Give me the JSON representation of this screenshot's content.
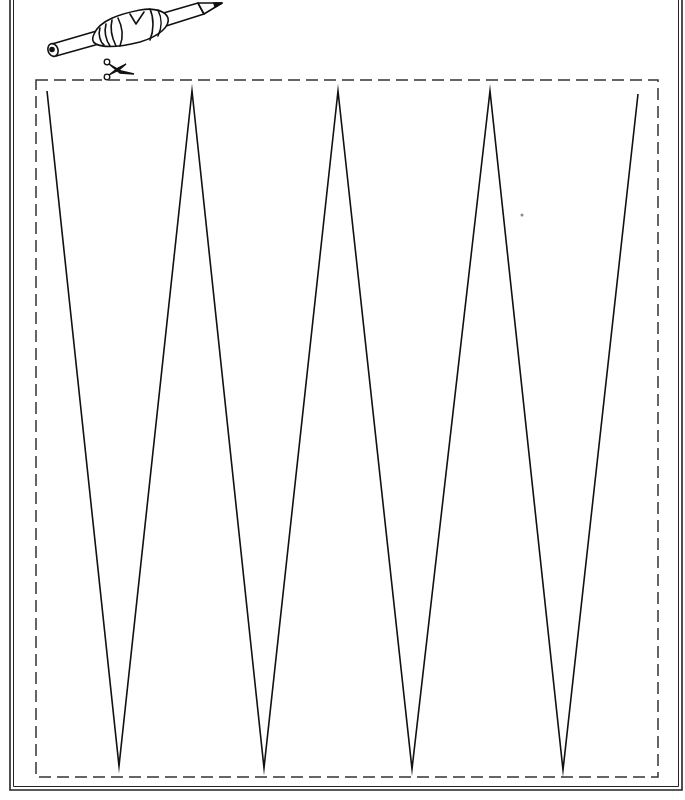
{
  "worksheet": {
    "type": "tracing-worksheet",
    "colors": {
      "background": "#ffffff",
      "ink": "#111111",
      "frame": "#222222",
      "dash": "#333333"
    },
    "frame": {
      "outer_left": 10,
      "outer_right": 682,
      "bottom": 790,
      "double_gap": 3
    },
    "cut_line": {
      "x": 36,
      "y": 80,
      "width": 622,
      "height": 697,
      "dash": "12 6"
    },
    "zigzag": {
      "points": [
        [
          47,
          91
        ],
        [
          119,
          766
        ],
        [
          192,
          91
        ],
        [
          264,
          768
        ],
        [
          338,
          91
        ],
        [
          412,
          769
        ],
        [
          490,
          91
        ],
        [
          563,
          770
        ],
        [
          638,
          94
        ]
      ],
      "peak_count": 5,
      "valley_count": 4
    },
    "icons": [
      "pencil-with-grip-icon",
      "scissors-icon"
    ]
  }
}
